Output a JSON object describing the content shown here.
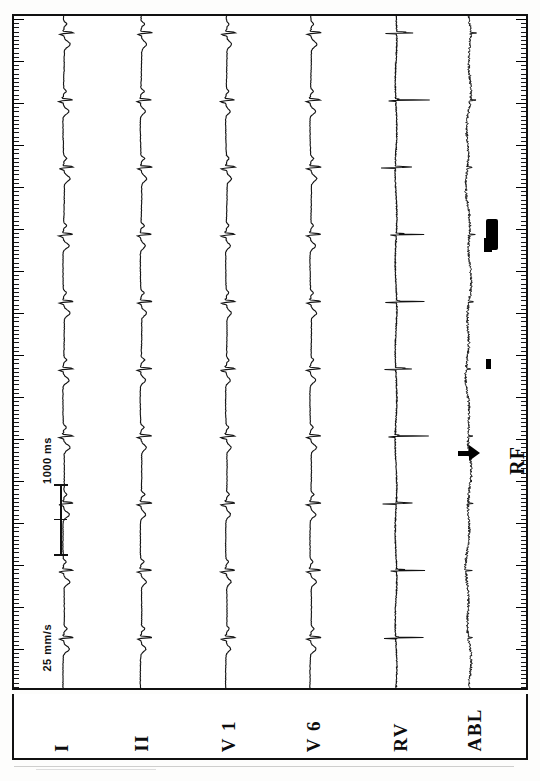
{
  "recording": {
    "title": "Intracardiac electrophysiology recording",
    "orientation": "rotated-90-ccw",
    "paper_speed": "25 mm/s",
    "time_marker": "1000 ms",
    "event_label": "RF",
    "event_marker_icon": "right-arrow-icon"
  },
  "leads": [
    {
      "id": "I",
      "label": "I",
      "type": "surface-ecg",
      "x": 62
    },
    {
      "id": "II",
      "label": "II",
      "type": "surface-ecg",
      "x": 140
    },
    {
      "id": "V1",
      "label": "V 1",
      "type": "surface-ecg",
      "x": 226
    },
    {
      "id": "V6",
      "label": "V 6",
      "type": "surface-ecg",
      "x": 311
    },
    {
      "id": "RV",
      "label": "RV",
      "type": "intracardiac",
      "x": 397
    },
    {
      "id": "ABL",
      "label": "ABL",
      "type": "intracardiac",
      "x": 470
    }
  ],
  "annotations": {
    "speed": "25 mm/s",
    "interval": "1000 ms",
    "rf_onset": "RF"
  },
  "chart_data": {
    "type": "line",
    "xlabel": "",
    "ylabel": "",
    "grid": false,
    "legend_position": "bottom",
    "orientation": "vertical-sweep",
    "time_scale": "25 mm/s",
    "calibration_interval_ms": 1000,
    "channels": [
      "I",
      "II",
      "V 1",
      "V 6",
      "RV",
      "ABL"
    ],
    "series": [
      {
        "name": "I",
        "kind": "surface-ecg",
        "beats": 10
      },
      {
        "name": "II",
        "kind": "surface-ecg",
        "beats": 10
      },
      {
        "name": "V 1",
        "kind": "surface-ecg",
        "beats": 10
      },
      {
        "name": "V 6",
        "kind": "surface-ecg",
        "beats": 10
      },
      {
        "name": "RV",
        "kind": "intracardiac",
        "beats": 10
      },
      {
        "name": "ABL",
        "kind": "intracardiac",
        "beats": 10
      }
    ],
    "events": [
      {
        "label": "RF",
        "marker": "arrow",
        "channel": "ABL",
        "position_pct": 62
      }
    ]
  },
  "colors": {
    "ink": "#111111",
    "paper": "#ffffff",
    "frame": "#111111"
  }
}
